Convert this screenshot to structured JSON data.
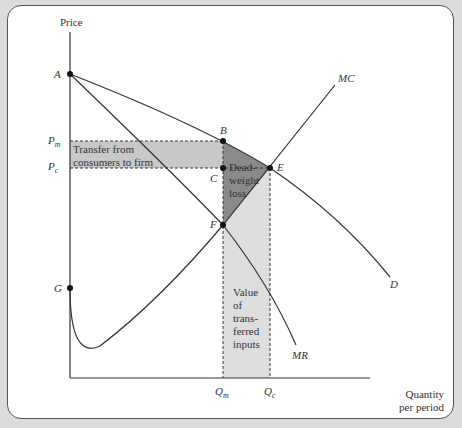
{
  "diagram": {
    "axes": {
      "y_label": "Price",
      "x_label_line1": "Quantity",
      "x_label_line2": "per period"
    },
    "price_ticks": {
      "pm": "P",
      "pm_sub": "m",
      "pc": "P",
      "pc_sub": "c"
    },
    "quantity_ticks": {
      "qm": "Q",
      "qm_sub": "m",
      "qc": "Q",
      "qc_sub": "c"
    },
    "points": {
      "A": "A",
      "B": "B",
      "C": "C",
      "E": "E",
      "F": "F",
      "G": "G"
    },
    "curves": {
      "mc": "MC",
      "d": "D",
      "mr": "MR"
    },
    "regions": {
      "transfer_line1": "Transfer from",
      "transfer_line2": "consumers to firm",
      "dwl_line1": "Dead-",
      "dwl_line2": "weight",
      "dwl_line3": "loss",
      "inputs_line1": "Value",
      "inputs_line2": "of",
      "inputs_line3": "trans-",
      "inputs_line4": "ferred",
      "inputs_line5": "inputs"
    },
    "colors": {
      "transfer_fill": "#c8c8c8",
      "dwl_fill": "#8a8a8a",
      "inputs_fill": "#dedede",
      "line": "#333333"
    }
  }
}
